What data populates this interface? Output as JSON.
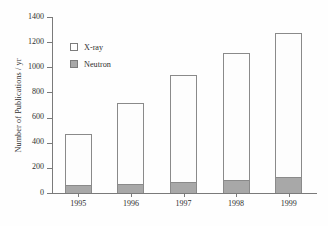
{
  "chart_data": {
    "type": "bar",
    "title": "",
    "subtitle": "",
    "stacked": true,
    "xlabel": "",
    "ylabel": "Number of Publications / yr",
    "categories": [
      "1995",
      "1996",
      "1997",
      "1998",
      "1999"
    ],
    "series": [
      {
        "name": "Neutron",
        "color": "#a8a8a8",
        "values": [
          60,
          75,
          90,
          105,
          125
        ]
      },
      {
        "name": "X-ray",
        "color": "#ffffff",
        "values": [
          410,
          645,
          845,
          1005,
          1150
        ]
      }
    ],
    "totals": [
      470,
      720,
      935,
      1110,
      1275
    ],
    "ylim": [
      0,
      1400
    ],
    "ytick_labels": [
      "0",
      "200",
      "400",
      "600",
      "800",
      "1000",
      "1200",
      "1400"
    ],
    "ytick_values": [
      0,
      200,
      400,
      600,
      800,
      1000,
      1200,
      1400
    ],
    "grid": false,
    "legend_position": "upper-left",
    "legend": [
      {
        "label": "X-ray",
        "swatch": "white-square"
      },
      {
        "label": "Neutron",
        "swatch": "gray-square"
      }
    ]
  }
}
